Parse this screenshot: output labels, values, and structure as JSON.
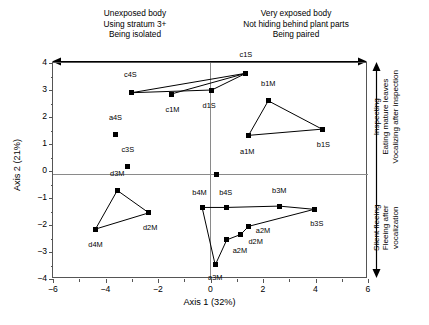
{
  "header": {
    "left_lines": [
      "Unexposed body",
      "Using stratum 3+",
      "Being isolated"
    ],
    "right_lines": [
      "Very exposed body",
      "Not hiding behind plant parts",
      "Being paired"
    ]
  },
  "side_labels": {
    "top_group": [
      "Inspecting",
      "Eating mature leaves",
      "Vocalizing after inspection"
    ],
    "bottom_group": [
      "Silent fleeing",
      "Fleeing after",
      "vocalization"
    ]
  },
  "chart_data": {
    "type": "scatter",
    "title": "",
    "xlabel": "Axis 1 (32%)",
    "ylabel": "Axis 2 (21%)",
    "xlim": [
      -6,
      6
    ],
    "ylim": [
      -4,
      4
    ],
    "xticks": [
      -6,
      -4,
      -2,
      0,
      2,
      4,
      6
    ],
    "yticks": [
      -4,
      -3,
      -2,
      -1,
      0,
      1,
      2,
      3,
      4
    ],
    "xtick_labels": [
      "−6",
      "−4",
      "−2",
      "0",
      "2",
      "4",
      "6"
    ],
    "ytick_labels": [
      "−4",
      "−3",
      "−2",
      "−1",
      "0",
      "1",
      "2",
      "3",
      "4"
    ],
    "grid": false,
    "legend": false,
    "marker": "filled-square",
    "marker_color": "#000000",
    "zero_lines": true,
    "points": [
      {
        "label": "c4S",
        "x": -3.0,
        "y": 2.9,
        "lx": -3.05,
        "ly": 3.55,
        "anchor": "center"
      },
      {
        "label": "c1M",
        "x": -1.5,
        "y": 2.85,
        "lx": -1.45,
        "ly": 2.25,
        "anchor": "center"
      },
      {
        "label": "d1S",
        "x": 0.05,
        "y": 3.0,
        "lx": -0.05,
        "ly": 2.4,
        "anchor": "center"
      },
      {
        "label": "c1S",
        "x": 1.35,
        "y": 3.62,
        "lx": 1.35,
        "ly": 4.28,
        "anchor": "center"
      },
      {
        "label": "b1M",
        "x": 2.2,
        "y": 2.6,
        "lx": 2.2,
        "ly": 3.22,
        "anchor": "center"
      },
      {
        "label": "b1S",
        "x": 4.25,
        "y": 1.55,
        "lx": 4.3,
        "ly": 0.95,
        "anchor": "center"
      },
      {
        "label": "a1M",
        "x": 1.45,
        "y": 1.32,
        "lx": 1.4,
        "ly": 0.72,
        "anchor": "center"
      },
      {
        "label": "a4S",
        "x": -3.62,
        "y": 1.35,
        "lx": -3.62,
        "ly": 1.98,
        "anchor": "center"
      },
      {
        "label": "c3S",
        "x": -3.15,
        "y": 0.15,
        "lx": -3.15,
        "ly": 0.78,
        "anchor": "center"
      },
      {
        "label": "d3M",
        "x": -3.55,
        "y": -0.72,
        "lx": -3.55,
        "ly": -0.12,
        "anchor": "center"
      },
      {
        "label": "d2M",
        "x": -2.35,
        "y": -1.55,
        "lx": -2.3,
        "ly": -2.12,
        "anchor": "center"
      },
      {
        "label": "d4M",
        "x": -4.38,
        "y": -2.15,
        "lx": -4.38,
        "ly": -2.75,
        "anchor": "center"
      },
      {
        "label": "b4M",
        "x": -0.32,
        "y": -1.35,
        "lx": -0.42,
        "ly": -0.8,
        "anchor": "center"
      },
      {
        "label": "b4S",
        "x": 0.6,
        "y": -1.35,
        "lx": 0.58,
        "ly": -0.8,
        "anchor": "center"
      },
      {
        "label": "b3M",
        "x": 2.62,
        "y": -1.3,
        "lx": 2.62,
        "ly": -0.75,
        "anchor": "center"
      },
      {
        "label": "b3S",
        "x": 3.95,
        "y": -1.42,
        "lx": 4.05,
        "ly": -1.98,
        "anchor": "center"
      },
      {
        "label": "a2M",
        "x": 1.45,
        "y": -2.05,
        "lx": 2.0,
        "ly": -2.22,
        "anchor": "center"
      },
      {
        "label": "d2M",
        "x": 1.15,
        "y": -2.35,
        "lx": 1.72,
        "ly": -2.62,
        "anchor": "center"
      },
      {
        "label": "a2M",
        "x": 0.62,
        "y": -2.55,
        "lx": 1.12,
        "ly": -2.98,
        "anchor": "center"
      },
      {
        "label": "a3M",
        "x": 0.18,
        "y": -3.48,
        "lx": 0.18,
        "ly": -3.95,
        "anchor": "center"
      },
      {
        "label": "",
        "x": 0.22,
        "y": -0.12,
        "lx": 0,
        "ly": 0,
        "anchor": "none"
      }
    ],
    "polylines": [
      {
        "name": "c-group-upper",
        "points": [
          [
            -3.0,
            2.9
          ],
          [
            1.35,
            3.62
          ],
          [
            0.05,
            3.0
          ],
          [
            -3.0,
            2.9
          ]
        ]
      },
      {
        "name": "c1m-connector",
        "points": [
          [
            -1.5,
            2.85
          ],
          [
            1.35,
            3.62
          ]
        ]
      },
      {
        "name": "b-a-triangle",
        "points": [
          [
            1.45,
            1.32
          ],
          [
            2.2,
            2.6
          ],
          [
            4.25,
            1.55
          ],
          [
            1.45,
            1.32
          ]
        ]
      },
      {
        "name": "d-triangle",
        "points": [
          [
            -4.38,
            -2.15
          ],
          [
            -3.55,
            -0.72
          ],
          [
            -2.35,
            -1.55
          ],
          [
            -4.38,
            -2.15
          ]
        ]
      },
      {
        "name": "lower-right-chain",
        "points": [
          [
            -0.32,
            -1.35
          ],
          [
            0.6,
            -1.35
          ],
          [
            2.62,
            -1.3
          ],
          [
            3.95,
            -1.42
          ],
          [
            1.45,
            -2.05
          ],
          [
            1.15,
            -2.35
          ],
          [
            0.62,
            -2.55
          ],
          [
            0.18,
            -3.48
          ],
          [
            -0.32,
            -1.35
          ]
        ]
      }
    ]
  }
}
